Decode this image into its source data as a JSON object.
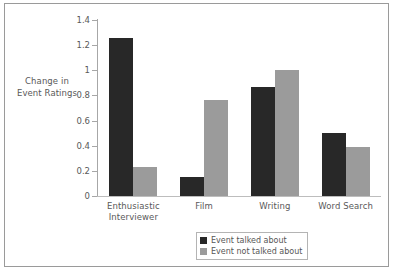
{
  "chart_data": {
    "type": "bar",
    "title": "",
    "xlabel": "",
    "ylabel": "Change in Event Ratings",
    "ylabel_lines": [
      "Change in",
      "Event Ratings"
    ],
    "categories": [
      "Enthusiastic Interviewer",
      "Film",
      "Writing",
      "Word Search"
    ],
    "category_lines": [
      [
        "Enthusiastic",
        "Interviewer"
      ],
      [
        "Film"
      ],
      [
        "Writing"
      ],
      [
        "Word Search"
      ]
    ],
    "series": [
      {
        "name": "Event talked about",
        "color": "#282828",
        "values": [
          1.26,
          0.15,
          0.87,
          0.5
        ]
      },
      {
        "name": "Event not talked about",
        "color": "#9b9b9b",
        "values": [
          0.23,
          0.76,
          1.0,
          0.39
        ]
      }
    ],
    "ylim": [
      0,
      1.4
    ],
    "yticks": [
      0,
      0.2,
      0.4,
      0.6,
      0.8,
      1,
      1.2,
      1.4
    ],
    "ytick_labels": [
      "0",
      "0.2",
      "0.4",
      "0.6",
      "0.8",
      "1",
      "1.2",
      "1.4"
    ],
    "grid": false,
    "legend_position": "bottom-center"
  },
  "legend": {
    "items": [
      {
        "label": "Event talked about",
        "swatch": "dark"
      },
      {
        "label": "Event not talked about",
        "swatch": "light"
      }
    ]
  }
}
